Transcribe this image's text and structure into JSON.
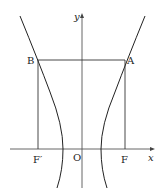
{
  "diagram": {
    "labels": {
      "y_axis": "y",
      "x_axis": "x",
      "origin": "O",
      "point_A": "A",
      "point_B": "B",
      "focus_F": "F",
      "focus_F_prime": "F′"
    },
    "colors": {
      "stroke": "#222222",
      "axis": "#555555",
      "background": "#ffffff"
    }
  }
}
